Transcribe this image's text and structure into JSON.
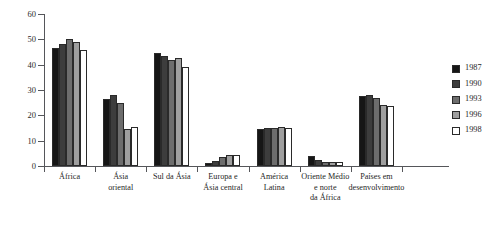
{
  "chart_data": {
    "type": "bar",
    "title": "",
    "subtitle": "",
    "xlabel": "",
    "ylabel": "",
    "ylim": [
      0,
      60
    ],
    "yticks": [
      0,
      10,
      20,
      30,
      40,
      50,
      60
    ],
    "grid": false,
    "legend_position": "right",
    "categories": [
      "África",
      "Ásia\noriental",
      "Sul da Ásia",
      "Europa e\nÁsia central",
      "América\nLatina",
      "Oriente Médio\ne norte\nda África",
      "Países em\ndesenvolvimento"
    ],
    "series": [
      {
        "name": "1987",
        "color": "#161616",
        "values": [
          46.5,
          26.5,
          44.5,
          1.0,
          14.5,
          4.0,
          27.5
        ]
      },
      {
        "name": "1990",
        "color": "#3d3d3d",
        "values": [
          48.0,
          28.0,
          43.5,
          2.0,
          15.0,
          2.5,
          28.0
        ]
      },
      {
        "name": "1993",
        "color": "#6d6d6d",
        "values": [
          50.0,
          25.0,
          42.0,
          3.5,
          15.0,
          1.5,
          27.0
        ]
      },
      {
        "name": "1996",
        "color": "#9f9f9f",
        "values": [
          49.0,
          14.8,
          42.5,
          4.5,
          15.5,
          1.5,
          24.0
        ]
      },
      {
        "name": "1998",
        "color": "#ffffff",
        "values": [
          45.8,
          15.3,
          39.0,
          4.5,
          15.0,
          1.5,
          23.5
        ]
      }
    ]
  }
}
